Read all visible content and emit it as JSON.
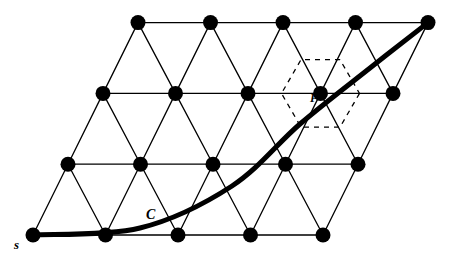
{
  "figure": {
    "background_color": "#ffffff",
    "stroke_color": "#000000",
    "vertex_color": "#000000",
    "vertex_radius": 7.5,
    "edge_width": 1.3,
    "curve_width": 5.0,
    "dashed_width": 1.3
  },
  "labels": {
    "start_vertex": "s",
    "lattice_point": "P",
    "curve": "C"
  },
  "chart_data": {
    "type": "diagram",
    "lattice": {
      "rows": 4,
      "cols": 5,
      "col_spacing": 72.5,
      "row_spacing": 70.8,
      "row_shear": -35.0,
      "origin_x": 33.0,
      "origin_y": 235.0,
      "vertices": [
        {
          "row": 0,
          "col": 0,
          "x": 33.0,
          "y": 235.0
        },
        {
          "row": 0,
          "col": 1,
          "x": 105.5,
          "y": 235.0
        },
        {
          "row": 0,
          "col": 2,
          "x": 178.0,
          "y": 235.0
        },
        {
          "row": 0,
          "col": 3,
          "x": 250.5,
          "y": 235.0
        },
        {
          "row": 0,
          "col": 4,
          "x": 323.0,
          "y": 235.0
        },
        {
          "row": 1,
          "col": 0,
          "x": 68.0,
          "y": 164.2
        },
        {
          "row": 1,
          "col": 1,
          "x": 140.5,
          "y": 164.2
        },
        {
          "row": 1,
          "col": 2,
          "x": 213.0,
          "y": 164.2
        },
        {
          "row": 1,
          "col": 3,
          "x": 285.5,
          "y": 164.2
        },
        {
          "row": 1,
          "col": 4,
          "x": 358.0,
          "y": 164.2
        },
        {
          "row": 2,
          "col": 0,
          "x": 103.0,
          "y": 93.4
        },
        {
          "row": 2,
          "col": 1,
          "x": 175.5,
          "y": 93.4
        },
        {
          "row": 2,
          "col": 2,
          "x": 248.0,
          "y": 93.4
        },
        {
          "row": 2,
          "col": 3,
          "x": 320.5,
          "y": 93.4
        },
        {
          "row": 2,
          "col": 4,
          "x": 393.0,
          "y": 93.4
        },
        {
          "row": 3,
          "col": 0,
          "x": 138.0,
          "y": 22.6
        },
        {
          "row": 3,
          "col": 1,
          "x": 210.5,
          "y": 22.6
        },
        {
          "row": 3,
          "col": 2,
          "x": 283.0,
          "y": 22.6
        },
        {
          "row": 3,
          "col": 3,
          "x": 355.5,
          "y": 22.6
        },
        {
          "row": 3,
          "col": 4,
          "x": 428.0,
          "y": 22.6
        }
      ]
    },
    "marked_point": {
      "name": "P",
      "x": 320.5,
      "y": 93.4,
      "label_x": 310,
      "label_y": 98
    },
    "voronoi_cell": {
      "shape": "hexagon",
      "center_x": 320.5,
      "center_y": 93.4,
      "radius": 39,
      "orientation_deg": 0,
      "style": "dashed"
    },
    "curve": {
      "name": "C",
      "style": "thick-solid",
      "start": {
        "x": 33.0,
        "y": 235.0,
        "label": "s"
      },
      "end": {
        "x": 428.0,
        "y": 22.6
      },
      "label_x": 150,
      "label_y": 216,
      "control_points": [
        {
          "x": 33.0,
          "y": 235.0
        },
        {
          "x": 140.0,
          "y": 228.0
        },
        {
          "x": 232.0,
          "y": 186.0
        },
        {
          "x": 300.0,
          "y": 124.0
        },
        {
          "x": 370.0,
          "y": 68.0
        },
        {
          "x": 428.0,
          "y": 22.6
        }
      ]
    },
    "xlabel": "",
    "ylabel": "",
    "grid": false,
    "legend": false
  }
}
